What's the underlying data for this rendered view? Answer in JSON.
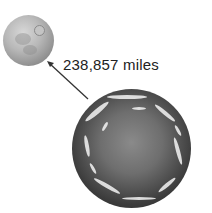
{
  "diagram": {
    "distance_label": "238,857 miles",
    "bodies": [
      {
        "name": "Moon",
        "position": "top-left"
      },
      {
        "name": "Earth",
        "position": "bottom-right"
      }
    ],
    "colors": {
      "background": "#ffffff",
      "arrow": "#333333",
      "text": "#222222"
    }
  }
}
